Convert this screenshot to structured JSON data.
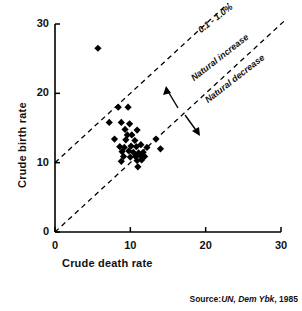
{
  "chart_data": {
    "type": "scatter",
    "title": "",
    "xlabel": "Crude death rate",
    "ylabel": "Crude birth rate",
    "xlim": [
      0,
      30
    ],
    "ylim": [
      0,
      30
    ],
    "xticks": [
      "0",
      "10",
      "20",
      "30"
    ],
    "yticks": [
      "0",
      "10",
      "20",
      "30"
    ],
    "xtick_values": [
      0,
      10,
      20,
      30
    ],
    "ytick_values": [
      0,
      10,
      20,
      30
    ],
    "grid": false,
    "legend": "none",
    "marker": "filled-diamond",
    "marker_color": "#000000",
    "points": [
      {
        "x": 5.7,
        "y": 26.5
      },
      {
        "x": 8.4,
        "y": 18.0
      },
      {
        "x": 9.7,
        "y": 18.0
      },
      {
        "x": 7.2,
        "y": 15.8
      },
      {
        "x": 8.8,
        "y": 15.8
      },
      {
        "x": 9.9,
        "y": 15.6
      },
      {
        "x": 9.3,
        "y": 14.8
      },
      {
        "x": 10.9,
        "y": 14.7
      },
      {
        "x": 9.6,
        "y": 14.0
      },
      {
        "x": 10.2,
        "y": 14.0
      },
      {
        "x": 7.9,
        "y": 13.4
      },
      {
        "x": 9.4,
        "y": 13.3
      },
      {
        "x": 10.6,
        "y": 13.2
      },
      {
        "x": 13.4,
        "y": 13.4
      },
      {
        "x": 8.6,
        "y": 12.3
      },
      {
        "x": 9.2,
        "y": 12.2
      },
      {
        "x": 10.1,
        "y": 12.4
      },
      {
        "x": 10.8,
        "y": 12.3
      },
      {
        "x": 11.4,
        "y": 12.6
      },
      {
        "x": 12.2,
        "y": 12.2
      },
      {
        "x": 14.0,
        "y": 12.0
      },
      {
        "x": 8.9,
        "y": 11.6
      },
      {
        "x": 9.8,
        "y": 11.7
      },
      {
        "x": 10.4,
        "y": 11.5
      },
      {
        "x": 11.1,
        "y": 11.4
      },
      {
        "x": 11.7,
        "y": 11.5
      },
      {
        "x": 9.1,
        "y": 10.9
      },
      {
        "x": 10.0,
        "y": 10.8
      },
      {
        "x": 10.7,
        "y": 10.9
      },
      {
        "x": 11.3,
        "y": 11.0
      },
      {
        "x": 11.9,
        "y": 10.9
      },
      {
        "x": 8.8,
        "y": 10.2
      },
      {
        "x": 10.9,
        "y": 10.3
      },
      {
        "x": 11.5,
        "y": 10.4
      },
      {
        "x": 11.0,
        "y": 9.4
      }
    ],
    "reference_lines": [
      {
        "name": "upper-growth-line",
        "style": "dashed",
        "from": {
          "x": 0.0,
          "y": 10.0
        },
        "to": {
          "x": 23.0,
          "y": 33.0
        }
      },
      {
        "name": "equal-rates-line",
        "style": "dashed",
        "from": {
          "x": 0.0,
          "y": 0.0
        },
        "to": {
          "x": 30.5,
          "y": 30.5
        }
      }
    ],
    "annotations": [
      {
        "name": "growth-band-label",
        "text": "0.1 - 1.0%",
        "rotation": -38
      },
      {
        "name": "natural-increase-label",
        "text": "Natural increase",
        "rotation": -38
      },
      {
        "name": "natural-decrease-label",
        "text": "Natural decrease",
        "rotation": -38
      },
      {
        "name": "increase-arrow",
        "direction": "up-left"
      },
      {
        "name": "decrease-arrow",
        "direction": "down-right"
      }
    ],
    "source_prefix": "Source:",
    "source_italic": "UN, Dem Ybk",
    "source_suffix": ", 1985"
  },
  "axes": {
    "x_title": "Crude death rate",
    "y_title": "Crude birth rate",
    "x_ticks": [
      "0",
      "10",
      "20",
      "30"
    ],
    "y_ticks": [
      "0",
      "10",
      "20",
      "30"
    ]
  },
  "labels": {
    "growth_band": "0.1 - 1.0%",
    "natural_increase": "Natural increase",
    "natural_decrease": "Natural decrease"
  },
  "source": {
    "prefix": "Source:",
    "italic": "UN, Dem Ybk",
    "suffix": ", 1985"
  },
  "colors": {
    "ink": "#000000",
    "background": "#ffffff"
  }
}
